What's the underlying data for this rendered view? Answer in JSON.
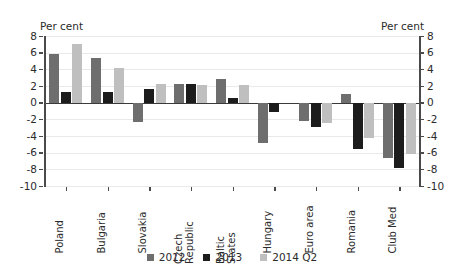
{
  "chart_data": {
    "type": "bar",
    "title": "",
    "xlabel": "",
    "ylabel": "Per cent",
    "ylabel_right": "Per cent",
    "ylim": [
      -10,
      8
    ],
    "yticks": [
      8,
      6,
      4,
      2,
      0,
      -2,
      -4,
      -6,
      -8,
      -10
    ],
    "ytick_labels": [
      "8",
      "6",
      "4",
      "2",
      "0",
      "-2",
      "-4",
      "-6",
      "-8",
      "-10"
    ],
    "grid": true,
    "legend_position": "bottom",
    "categories": [
      "Poland",
      "Bulgaria",
      "Slovakia",
      "Czech\nRepublic",
      "Baltic\nStates",
      "Hungary",
      "Euro area",
      "Romania",
      "Club Med"
    ],
    "series": [
      {
        "name": "2012",
        "color": "#6e6e6e",
        "values": [
          5.8,
          5.4,
          -2.3,
          2.2,
          2.8,
          -4.9,
          -2.2,
          1.1,
          -6.6
        ]
      },
      {
        "name": "2013",
        "color": "#1c1c1c",
        "values": [
          1.3,
          1.3,
          1.7,
          2.2,
          0.6,
          -1.1,
          -2.9,
          -5.6,
          -7.8
        ]
      },
      {
        "name": "2014 Q2",
        "color": "#bfbfbf",
        "values": [
          7.0,
          4.2,
          2.2,
          2.1,
          2.1,
          null,
          -2.4,
          -4.2,
          -6.2
        ]
      }
    ]
  }
}
